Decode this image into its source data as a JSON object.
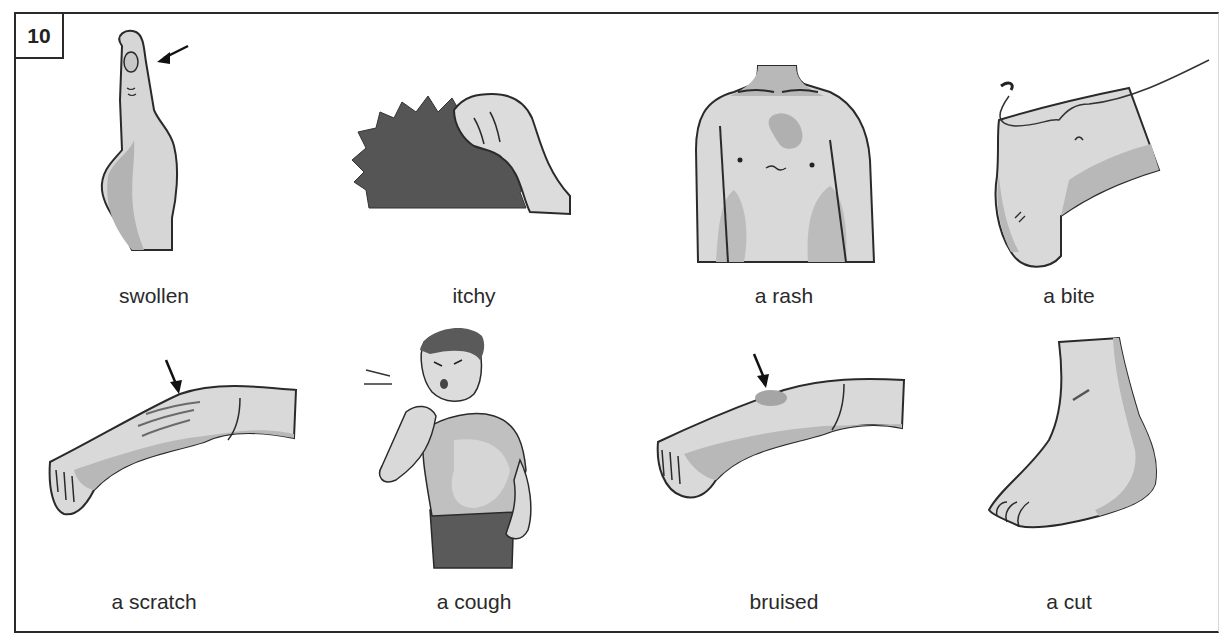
{
  "exercise": {
    "number": "10",
    "items": [
      {
        "label": "swollen",
        "icon": "swollen-finger-icon"
      },
      {
        "label": "itchy",
        "icon": "itchy-scratching-hand-icon"
      },
      {
        "label": "a rash",
        "icon": "rash-on-chest-icon"
      },
      {
        "label": "a bite",
        "icon": "insect-bite-on-knee-icon"
      },
      {
        "label": "a scratch",
        "icon": "scratched-arm-icon"
      },
      {
        "label": "a cough",
        "icon": "coughing-man-icon"
      },
      {
        "label": "bruised",
        "icon": "bruised-arm-icon"
      },
      {
        "label": "a cut",
        "icon": "cut-foot-icon"
      }
    ]
  },
  "colors": {
    "outline": "#2a2a2a",
    "skin_light": "#d9d9d9",
    "skin_shadow": "#b3b3b3",
    "dark_fill": "#555555"
  }
}
